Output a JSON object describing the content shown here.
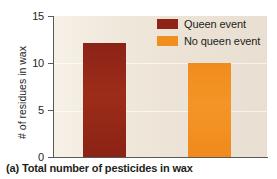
{
  "chart_data": {
    "type": "bar",
    "title": "",
    "caption": "(a) Total number of pesticides in wax",
    "categories": [
      "Queen event",
      "No queen event"
    ],
    "values": [
      12.1,
      10.0
    ],
    "xlabel": "",
    "ylabel": "# of residues in wax",
    "ylim": [
      0,
      15
    ],
    "yticks": [
      0,
      5,
      10,
      15
    ],
    "ytick_labels": [
      "0",
      "5",
      "10",
      "15"
    ],
    "grid": true,
    "grid_axis": "y",
    "legend_position": "top-right",
    "series": [
      {
        "name": "Queen event",
        "value": 12.1,
        "color": "#8f2316"
      },
      {
        "name": "No queen event",
        "value": 10.0,
        "color": "#f18e20"
      }
    ]
  },
  "axis": {
    "y_title": "# of residues in wax",
    "ticks": [
      {
        "label": "15",
        "value": 15
      },
      {
        "label": "10",
        "value": 10
      },
      {
        "label": "5",
        "value": 5
      },
      {
        "label": "0",
        "value": 0
      }
    ]
  },
  "legend": {
    "items": [
      {
        "label": "Queen event",
        "color": "#8f2316"
      },
      {
        "label": "No queen event",
        "color": "#f18e20"
      }
    ]
  },
  "caption": {
    "text": "(a) Total number of pesticides in wax"
  },
  "colors": {
    "queen": "#8f2316",
    "no_queen": "#f18e20",
    "plot_background": "#ece3d6",
    "axis": "#58595b",
    "text": "#231f20"
  }
}
